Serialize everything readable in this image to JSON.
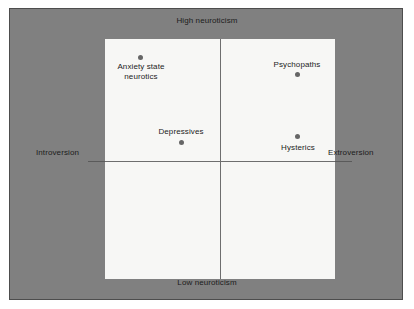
{
  "chart_data": {
    "type": "scatter",
    "title": "",
    "xlabel": "",
    "ylabel": "",
    "xlim": [
      -1,
      1
    ],
    "ylim": [
      -1,
      1
    ],
    "grid": false,
    "legend": null,
    "axis_poles": {
      "top": "High neuroticism",
      "bottom": "Low neuroticism",
      "left": "Introversion",
      "right": "Extroversion"
    },
    "points": [
      {
        "label": "Anxiety state\nneurotics",
        "quadrant": "introverted-high-neuroticism",
        "x": -0.69,
        "y": 0.87,
        "label_position": "below"
      },
      {
        "label": "Psychopaths",
        "quadrant": "extroverted-high-neuroticism",
        "x": 0.65,
        "y": 0.72,
        "label_position": "above"
      },
      {
        "label": "Depressives",
        "quadrant": "introverted-high-neuroticism",
        "x": -0.34,
        "y": 0.16,
        "label_position": "above"
      },
      {
        "label": "Hysterics",
        "quadrant": "extroverted-high-neuroticism",
        "x": 0.65,
        "y": 0.21,
        "label_position": "below"
      }
    ]
  },
  "colors": {
    "backdrop": "#808080",
    "plot_area": "#f7f7f5",
    "axis": "#6e6e6e",
    "point": "#666666",
    "text": "#1c1c1c"
  }
}
